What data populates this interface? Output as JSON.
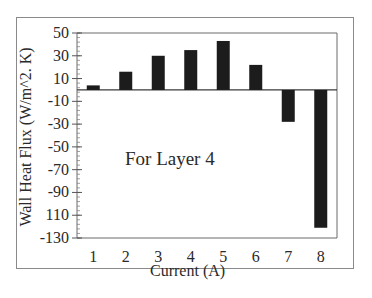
{
  "chart_data": {
    "type": "bar",
    "title": "",
    "annotation": "For Layer 4",
    "xlabel": "Current (A)",
    "ylabel": "Wall Heat Flux (W/m^2. K)",
    "categories": [
      "1",
      "2",
      "3",
      "4",
      "5",
      "6",
      "7",
      "8"
    ],
    "values": [
      4,
      16,
      30,
      35,
      43,
      22,
      -28,
      -121
    ],
    "ylim": [
      -130,
      50
    ],
    "yticks": [
      50,
      30,
      10,
      -10,
      -30,
      -50,
      -70,
      -90,
      -110,
      -130
    ],
    "ytick_labels": [
      "50",
      "30",
      "10",
      "-10",
      "-30",
      "-50",
      "-70",
      "-90",
      "110",
      "-130"
    ],
    "bar_color": "#1c1c1c",
    "grid": false,
    "legend": null
  }
}
